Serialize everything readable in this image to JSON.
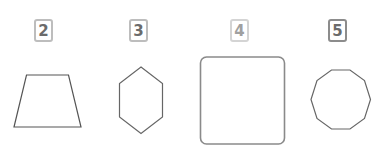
{
  "figures": [
    {
      "label": "2",
      "shape": "trapezoid",
      "sides": 4,
      "label_style": "normal",
      "stroke": "#555555"
    },
    {
      "label": "3",
      "shape": "hexagon",
      "sides": 6,
      "label_style": "normal",
      "stroke": "#666666"
    },
    {
      "label": "4",
      "shape": "rounded-square",
      "sides": 4,
      "label_style": "light",
      "stroke": "#8a8a8a"
    },
    {
      "label": "5",
      "shape": "decagon",
      "sides": 10,
      "label_style": "dark",
      "stroke": "#666666"
    }
  ],
  "colors": {
    "background": "#ffffff",
    "label_border": "#bdbdbd",
    "label_border_light": "#d4d4d4",
    "label_border_dark": "#8c8c8c",
    "label_text": "#6b6b6b",
    "label_text_light": "#a0a0a0"
  }
}
